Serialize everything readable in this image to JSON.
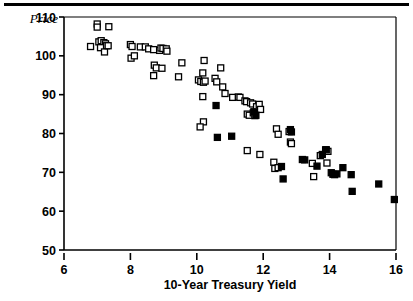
{
  "figure": {
    "background_color": "#ffffff",
    "foreground_color": "#000000",
    "top_rule": true
  },
  "axis": {
    "y_label": "Price",
    "x_label": "10-Year Treasury Yield",
    "x_ticks": [
      "6",
      "8",
      "10",
      "12",
      "14",
      "16"
    ],
    "y_ticks": [
      "110",
      "100",
      "90",
      "80",
      "70",
      "60",
      "50"
    ]
  },
  "chart_data": {
    "type": "scatter",
    "title": "",
    "xlabel": "10-Year Treasury Yield",
    "ylabel": "Price",
    "xlim": [
      6,
      16
    ],
    "ylim": [
      50,
      110
    ],
    "xticks": [
      6,
      8,
      10,
      12,
      14,
      16
    ],
    "yticks": [
      50,
      60,
      70,
      80,
      90,
      100,
      110
    ],
    "grid": false,
    "legend": null,
    "marker_size_px": 6,
    "series": [
      {
        "name": "open-square",
        "marker": "open-square",
        "fill": "#ffffff",
        "stroke": "#000000",
        "points": [
          [
            6.8,
            102.4
          ],
          [
            7.0,
            108.2
          ],
          [
            7.0,
            107.4
          ],
          [
            7.35,
            107.5
          ],
          [
            7.05,
            103.6
          ],
          [
            7.12,
            103.9
          ],
          [
            7.2,
            103.4
          ],
          [
            7.25,
            103.1
          ],
          [
            7.28,
            102.6
          ],
          [
            7.1,
            102.1
          ],
          [
            7.22,
            101.0
          ],
          [
            7.33,
            102.6
          ],
          [
            8.0,
            102.9
          ],
          [
            8.05,
            102.4
          ],
          [
            8.02,
            99.4
          ],
          [
            8.12,
            100.0
          ],
          [
            8.3,
            102.3
          ],
          [
            8.45,
            102.3
          ],
          [
            8.55,
            101.8
          ],
          [
            8.7,
            101.6
          ],
          [
            8.72,
            97.6
          ],
          [
            8.78,
            96.9
          ],
          [
            8.7,
            94.9
          ],
          [
            8.88,
            101.4
          ],
          [
            8.92,
            102.0
          ],
          [
            8.98,
            101.9
          ],
          [
            8.95,
            96.8
          ],
          [
            9.08,
            101.8
          ],
          [
            9.1,
            101.2
          ],
          [
            9.55,
            98.2
          ],
          [
            9.45,
            94.6
          ],
          [
            10.05,
            93.8
          ],
          [
            10.12,
            93.4
          ],
          [
            10.18,
            95.6
          ],
          [
            10.2,
            93.2
          ],
          [
            10.25,
            93.5
          ],
          [
            10.22,
            98.8
          ],
          [
            10.18,
            89.5
          ],
          [
            10.2,
            83.0
          ],
          [
            10.1,
            81.7
          ],
          [
            10.55,
            94.2
          ],
          [
            10.6,
            93.3
          ],
          [
            10.72,
            96.9
          ],
          [
            10.78,
            92.0
          ],
          [
            10.85,
            90.3
          ],
          [
            11.08,
            89.3
          ],
          [
            11.25,
            89.4
          ],
          [
            11.3,
            89.3
          ],
          [
            11.45,
            88.4
          ],
          [
            11.5,
            88.2
          ],
          [
            11.52,
            85.0
          ],
          [
            11.58,
            84.7
          ],
          [
            11.62,
            87.9
          ],
          [
            11.68,
            87.6
          ],
          [
            11.7,
            85.3
          ],
          [
            11.75,
            84.6
          ],
          [
            11.8,
            86.9
          ],
          [
            11.88,
            87.5
          ],
          [
            11.92,
            86.2
          ],
          [
            11.52,
            75.6
          ],
          [
            11.9,
            74.6
          ],
          [
            12.4,
            81.2
          ],
          [
            12.45,
            79.8
          ],
          [
            12.32,
            72.6
          ],
          [
            12.35,
            71.0
          ],
          [
            12.45,
            71.2
          ],
          [
            12.78,
            80.5
          ],
          [
            12.82,
            77.8
          ],
          [
            12.85,
            77.4
          ],
          [
            13.48,
            72.3
          ],
          [
            13.52,
            68.9
          ],
          [
            13.72,
            74.3
          ],
          [
            13.88,
            75.8
          ],
          [
            13.95,
            75.4
          ],
          [
            13.92,
            72.4
          ]
        ]
      },
      {
        "name": "filled-square",
        "marker": "filled-square",
        "fill": "#000000",
        "stroke": "#000000",
        "points": [
          [
            10.58,
            87.2
          ],
          [
            10.62,
            79.0
          ],
          [
            11.05,
            79.3
          ],
          [
            11.72,
            85.6
          ],
          [
            11.78,
            84.7
          ],
          [
            12.55,
            71.5
          ],
          [
            12.6,
            68.3
          ],
          [
            12.82,
            81.0
          ],
          [
            12.85,
            80.4
          ],
          [
            13.18,
            73.3
          ],
          [
            13.25,
            73.2
          ],
          [
            13.62,
            71.6
          ],
          [
            13.78,
            74.6
          ],
          [
            13.9,
            75.8
          ],
          [
            14.05,
            69.9
          ],
          [
            14.1,
            69.5
          ],
          [
            14.15,
            69.4
          ],
          [
            14.22,
            69.6
          ],
          [
            14.4,
            71.2
          ],
          [
            14.65,
            69.4
          ],
          [
            14.68,
            65.1
          ],
          [
            15.48,
            67.0
          ],
          [
            15.95,
            63.0
          ]
        ]
      }
    ]
  }
}
